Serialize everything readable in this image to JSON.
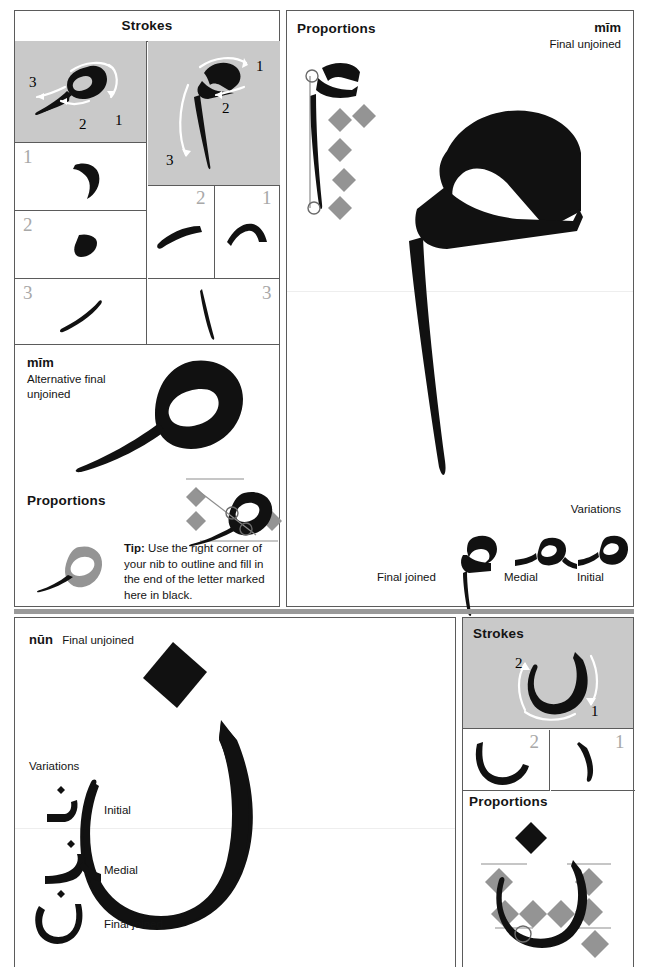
{
  "page": {
    "width": 648,
    "height": 967,
    "background": "#ffffff",
    "rule_color": "#9a9a9a",
    "border_color": "#5b5b5b",
    "gray_panel": "#c9c9c9",
    "diamond_color": "#949494",
    "ink_color": "#111111"
  },
  "mim_strokes_panel": {
    "header": "Strokes",
    "demo_left": {
      "numbers": [
        "3",
        "2",
        "1"
      ]
    },
    "demo_right": {
      "numbers": [
        "1",
        "2",
        "3"
      ]
    },
    "left_cells": [
      {
        "number": "1"
      },
      {
        "number": "2"
      },
      {
        "number": "3"
      }
    ],
    "right_cells": [
      {
        "number": "2"
      },
      {
        "number": "1"
      },
      {
        "number": "3"
      }
    ]
  },
  "mim_alt_panel": {
    "letter": "mīm",
    "subtitle_line1": "Alternative final",
    "subtitle_line2": "unjoined",
    "proportions_label": "Proportions",
    "tip_bold": "Tip:",
    "tip_text": " Use the right corner of your nib to outline and fill in the end of the letter marked here in black."
  },
  "mim_main_panel": {
    "proportions_label": "Proportions",
    "letter": "mīm",
    "subtitle": "Final unjoined",
    "variations_label": "Variations",
    "variations": [
      {
        "label": "Final joined"
      },
      {
        "label": "Medial"
      },
      {
        "label": "Initial"
      }
    ]
  },
  "nun_panel": {
    "letter": "nūn",
    "subtitle": "Final unjoined",
    "variations_label": "Variations",
    "variations": [
      {
        "label": "Initial"
      },
      {
        "label": "Medial"
      },
      {
        "label": "Final joined"
      }
    ]
  },
  "nun_strokes_panel": {
    "header": "Strokes",
    "demo_numbers": [
      "2",
      "1"
    ],
    "cells": [
      {
        "number": "2"
      },
      {
        "number": "1"
      }
    ]
  },
  "nun_proportions_panel": {
    "header": "Proportions"
  }
}
